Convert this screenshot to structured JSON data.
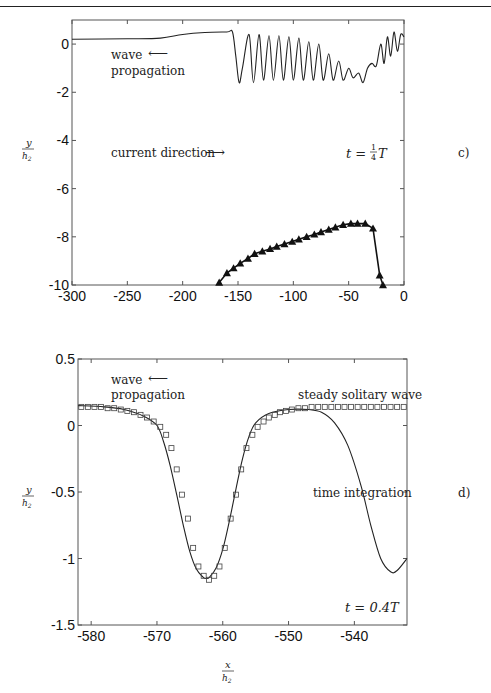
{
  "figure": {
    "panel_c": {
      "label": "c)",
      "ylabel_num": "y",
      "ylabel_den": "h2",
      "time_label": "t = ¼T",
      "annotations": {
        "wave_line1": "wave",
        "wave_line2": "propagation",
        "current": "current direction",
        "arrow_left": "⟵",
        "arrow_right": "⟶"
      }
    },
    "panel_d": {
      "label": "d)",
      "ylabel_num": "y",
      "ylabel_den": "h2",
      "xlabel_num": "x",
      "xlabel_den": "h2",
      "time_label": "t = 0.4T",
      "annotations": {
        "wave_line1": "wave",
        "wave_line2": "propagation",
        "arrow_left": "⟵",
        "steady": "steady solitary wave",
        "integration": "time integration"
      }
    }
  },
  "chart_data": [
    {
      "type": "line",
      "panel": "c)",
      "title": "",
      "annotation_time": "t = 1/4 T",
      "xlabel": "",
      "ylabel": "y/h2",
      "xlim": [
        -300,
        0
      ],
      "ylim": [
        -10,
        1
      ],
      "xticks": [
        -300,
        -250,
        -200,
        -150,
        -100,
        -50,
        0
      ],
      "xtick_labels": [
        "-300",
        "-250",
        "-200",
        "-150",
        "-100",
        "-50",
        "0"
      ],
      "yticks": [
        0,
        -2,
        -4,
        -6,
        -8,
        -10
      ],
      "ytick_labels": [
        "0",
        "-2",
        "-4",
        "-6",
        "-8",
        "-10"
      ],
      "grid": false,
      "series": [
        {
          "name": "interface elevation",
          "style": "solid line",
          "x": [
            -300,
            -250,
            -220,
            -200,
            -180,
            -160,
            -155,
            -152,
            -149,
            -146,
            -140,
            -136,
            -131,
            -127,
            -122,
            -118,
            -113,
            -109,
            -104,
            -100,
            -95,
            -91,
            -86,
            -82,
            -77,
            -73,
            -68,
            -64,
            -59,
            -55,
            -50,
            -46,
            -41,
            -37,
            -33,
            -29,
            -25,
            -21,
            -18,
            -15,
            -12,
            -9,
            -6,
            -3,
            0
          ],
          "y": [
            0.2,
            0.22,
            0.25,
            0.4,
            0.48,
            0.5,
            0.5,
            -0.5,
            -1.6,
            -1.0,
            0.4,
            -1.6,
            0.4,
            -1.5,
            0.35,
            -1.5,
            0.35,
            -1.5,
            0.3,
            -1.5,
            0.25,
            -1.5,
            0.1,
            -1.5,
            0.0,
            -1.5,
            -0.4,
            -1.5,
            -0.7,
            -1.5,
            -1.0,
            -1.4,
            -1.2,
            -1.6,
            -1.0,
            -0.8,
            -0.9,
            0.0,
            -0.8,
            0.3,
            -0.5,
            0.5,
            -0.3,
            0.4,
            0.3
          ]
        },
        {
          "name": "triangles",
          "style": "solid line with triangle markers",
          "x": [
            -167,
            -160,
            -154,
            -148,
            -141,
            -135,
            -128,
            -121,
            -115,
            -108,
            -101,
            -95,
            -88,
            -81,
            -75,
            -68,
            -62,
            -55,
            -48,
            -42,
            -35,
            -28,
            -22,
            -19
          ],
          "y": [
            -9.9,
            -9.5,
            -9.3,
            -9.1,
            -8.9,
            -8.7,
            -8.6,
            -8.5,
            -8.4,
            -8.3,
            -8.2,
            -8.1,
            -8.0,
            -7.9,
            -7.8,
            -7.7,
            -7.6,
            -7.5,
            -7.45,
            -7.45,
            -7.45,
            -7.65,
            -9.6,
            -10.0
          ]
        }
      ],
      "text_annotations": [
        "wave propagation ←",
        "current direction →",
        "t = 1/4 T",
        "c)"
      ]
    },
    {
      "type": "line",
      "panel": "d)",
      "title": "",
      "annotation_time": "t = 0.4T",
      "xlabel": "x/h2",
      "ylabel": "y/h2",
      "xlim": [
        -582,
        -532
      ],
      "ylim": [
        -1.5,
        0.5
      ],
      "xticks": [
        -580,
        -570,
        -560,
        -550,
        -540
      ],
      "xtick_labels": [
        "-580",
        "-570",
        "-560",
        "-550",
        "-540"
      ],
      "yticks": [
        0.5,
        0,
        -0.5,
        -1,
        -1.5
      ],
      "ytick_labels": [
        "0.5",
        "0",
        "-0.5",
        "-1",
        "-1.5"
      ],
      "grid": false,
      "legend": [
        {
          "name": "steady solitary wave",
          "style": "square markers"
        },
        {
          "name": "time integration",
          "style": "solid line"
        }
      ],
      "series": [
        {
          "name": "time integration",
          "style": "solid line",
          "x": [
            -582,
            -578,
            -575,
            -572,
            -570,
            -569,
            -568,
            -567,
            -566,
            -565,
            -564,
            -563,
            -562.5,
            -562,
            -561,
            -560,
            -559,
            -558,
            -557,
            -556,
            -555,
            -553,
            -550,
            -547,
            -545,
            -543,
            -541,
            -539,
            -537.5,
            -536,
            -534.5,
            -533.5,
            -532
          ],
          "y": [
            0.15,
            0.14,
            0.12,
            0.07,
            0.0,
            -0.12,
            -0.3,
            -0.52,
            -0.75,
            -0.95,
            -1.08,
            -1.14,
            -1.15,
            -1.14,
            -1.07,
            -0.93,
            -0.72,
            -0.48,
            -0.25,
            -0.08,
            0.02,
            0.09,
            0.12,
            0.12,
            0.1,
            0.02,
            -0.15,
            -0.45,
            -0.75,
            -1.0,
            -1.1,
            -1.09,
            -1.0
          ]
        },
        {
          "name": "steady solitary wave",
          "style": "square markers",
          "x": [
            -581.5,
            -580.5,
            -579.5,
            -578.5,
            -577.5,
            -576.5,
            -575.5,
            -574.5,
            -573.5,
            -572.5,
            -571.5,
            -570.5,
            -569.5,
            -568.6,
            -567.8,
            -567.0,
            -566.2,
            -565.3,
            -564.5,
            -563.7,
            -562.9,
            -562.1,
            -561.3,
            -560.5,
            -559.7,
            -558.8,
            -558.0,
            -557.2,
            -556.4,
            -555.5,
            -554.7,
            -553.8,
            -553.0,
            -552.1,
            -551.3,
            -550.4,
            -549.5,
            -548.5,
            -547.5,
            -546.5,
            -545.5,
            -544.5,
            -543.5,
            -542.5,
            -541.5,
            -540.5,
            -539.5,
            -538.5,
            -537.5,
            -536.5,
            -535.5,
            -534.5,
            -533.5,
            -532.5
          ],
          "y": [
            0.14,
            0.14,
            0.14,
            0.14,
            0.13,
            0.13,
            0.12,
            0.11,
            0.1,
            0.08,
            0.06,
            0.03,
            -0.01,
            -0.07,
            -0.17,
            -0.33,
            -0.52,
            -0.7,
            -0.92,
            -1.06,
            -1.13,
            -1.16,
            -1.13,
            -1.06,
            -0.92,
            -0.7,
            -0.52,
            -0.33,
            -0.17,
            -0.07,
            -0.01,
            0.03,
            0.06,
            0.08,
            0.1,
            0.11,
            0.12,
            0.13,
            0.13,
            0.14,
            0.14,
            0.14,
            0.14,
            0.14,
            0.14,
            0.14,
            0.14,
            0.14,
            0.14,
            0.14,
            0.14,
            0.14,
            0.14,
            0.14
          ]
        }
      ],
      "text_annotations": [
        "wave propagation ←",
        "steady solitary wave",
        "time integration",
        "t = 0.4T",
        "d)"
      ]
    }
  ]
}
